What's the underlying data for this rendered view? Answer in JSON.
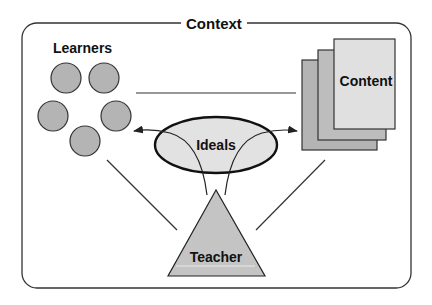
{
  "diagram": {
    "title": "Context",
    "nodes": {
      "learners": {
        "label": "Learners",
        "shape": "circle-group",
        "count": 5
      },
      "content": {
        "label": "Content",
        "shape": "stacked-pages",
        "count": 3
      },
      "ideals": {
        "label": "Ideals",
        "shape": "ellipse"
      },
      "teacher": {
        "label": "Teacher",
        "shape": "triangle"
      }
    },
    "edges": [
      {
        "from": "learners",
        "to": "content",
        "type": "line"
      },
      {
        "from": "teacher",
        "to": "learners",
        "type": "line"
      },
      {
        "from": "teacher",
        "to": "content",
        "type": "line"
      },
      {
        "from": "teacher",
        "to": "learners",
        "via": "ideals",
        "type": "arrow"
      },
      {
        "from": "teacher",
        "to": "content",
        "via": "ideals",
        "type": "arrow"
      }
    ],
    "colors": {
      "stroke": "#222222",
      "circle_fill": "#b4b4b4",
      "ideals_fill": "#e2e2e2",
      "teacher_fill": "#c4c4c4",
      "page_back_fill": "#b4b4b4",
      "page_mid_fill": "#bdbdbd",
      "page_front_fill": "#e0e0e0"
    }
  }
}
